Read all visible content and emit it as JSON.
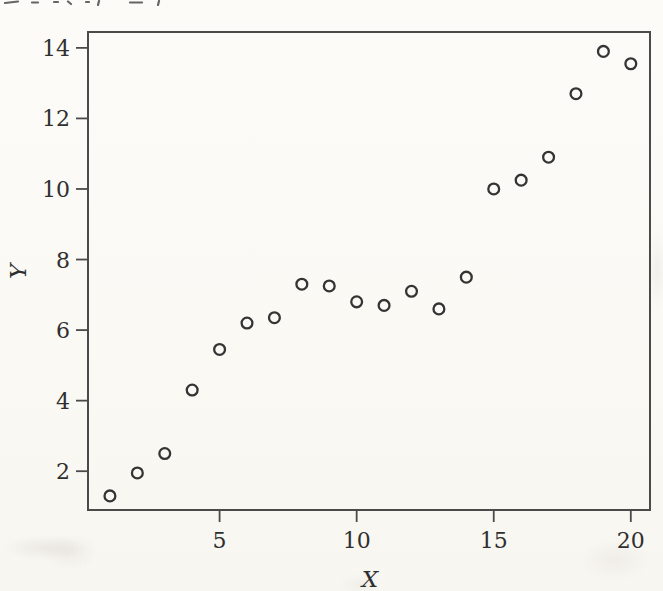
{
  "chart_data": {
    "type": "scatter",
    "title": "",
    "xlabel": "X",
    "ylabel": "Y",
    "x": [
      1,
      2,
      3,
      4,
      5,
      6,
      7,
      8,
      9,
      10,
      11,
      12,
      13,
      14,
      15,
      16,
      17,
      18,
      19,
      20
    ],
    "y": [
      1.3,
      1.95,
      2.5,
      4.3,
      5.45,
      6.2,
      6.35,
      7.3,
      7.25,
      6.8,
      6.7,
      7.1,
      6.6,
      7.5,
      10.0,
      10.25,
      10.9,
      12.7,
      13.9,
      13.55
    ],
    "x_ticks": [
      5,
      10,
      15,
      20
    ],
    "y_ticks": [
      2,
      4,
      6,
      8,
      10,
      12,
      14
    ],
    "xlim": [
      0.2,
      20.7
    ],
    "ylim": [
      0.9,
      14.45
    ],
    "grid": false,
    "legend_position": "none",
    "marker": {
      "shape": "open-circle",
      "radius_px": 5.4,
      "stroke_px": 2.3,
      "color": "#343434"
    },
    "frame_color": "#4a4a4a",
    "tick_label_color": "#2f2f2f",
    "background_color": "#fbfaf6"
  }
}
